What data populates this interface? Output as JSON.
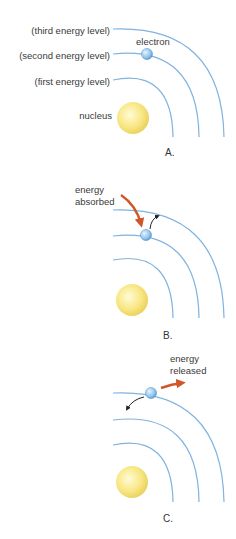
{
  "panels": [
    {
      "id": "A",
      "caption": "A.",
      "labels": {
        "third": "(third energy level)",
        "second": "(second energy level)",
        "first": "(first energy level)",
        "nucleus": "nucleus",
        "electron": "electron"
      }
    },
    {
      "id": "B",
      "caption": "B.",
      "annotation_line1": "energy",
      "annotation_line2": "absorbed"
    },
    {
      "id": "C",
      "caption": "C.",
      "annotation_line1": "energy",
      "annotation_line2": "released"
    }
  ],
  "colors": {
    "orbit": "#7fb3e0",
    "nucleus": "#f7e27a",
    "electron": "#8ec2ec",
    "energy_arrow": "#d0562a",
    "motion_arrow": "#222222"
  }
}
